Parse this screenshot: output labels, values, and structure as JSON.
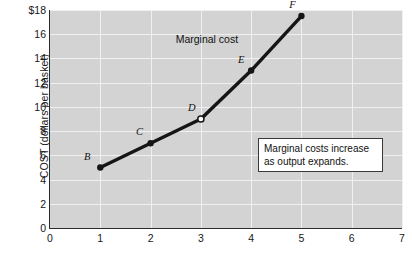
{
  "chart_data": {
    "type": "line",
    "title": "",
    "xlabel": "",
    "ylabel": "COST (dollars per basket)",
    "xlim": [
      0,
      7
    ],
    "ylim": [
      0,
      18
    ],
    "grid": true,
    "legend_position": "none",
    "x": [
      1,
      2,
      3,
      4,
      5
    ],
    "values": [
      5,
      7,
      9,
      13,
      17.5
    ],
    "series": [
      {
        "name": "Marginal cost",
        "x": [
          1,
          2,
          3,
          4,
          5
        ],
        "values": [
          5,
          7,
          9,
          13,
          17.5
        ]
      }
    ],
    "points": [
      {
        "label": "B",
        "x": 1,
        "y": 5,
        "marker": "filled"
      },
      {
        "label": "C",
        "x": 2,
        "y": 7,
        "marker": "filled"
      },
      {
        "label": "D",
        "x": 3,
        "y": 9,
        "marker": "open"
      },
      {
        "label": "E",
        "x": 4,
        "y": 13,
        "marker": "filled"
      },
      {
        "label": "F",
        "x": 5,
        "y": 17.5,
        "marker": "filled"
      }
    ],
    "y_ticks": [
      {
        "value": 18,
        "label": "$18"
      },
      {
        "value": 16,
        "label": "16"
      },
      {
        "value": 14,
        "label": "14"
      },
      {
        "value": 12,
        "label": "12"
      },
      {
        "value": 10,
        "label": "10"
      },
      {
        "value": 8,
        "label": "8"
      },
      {
        "value": 6,
        "label": "6"
      },
      {
        "value": 4,
        "label": "4"
      },
      {
        "value": 2,
        "label": "2"
      },
      {
        "value": 0,
        "label": "0"
      }
    ],
    "x_ticks": [
      {
        "value": 0,
        "label": "0"
      },
      {
        "value": 1,
        "label": "1"
      },
      {
        "value": 2,
        "label": "2"
      },
      {
        "value": 3,
        "label": "3"
      },
      {
        "value": 4,
        "label": "4"
      },
      {
        "value": 5,
        "label": "5"
      },
      {
        "value": 6,
        "label": "6"
      },
      {
        "value": 7,
        "label": "7"
      }
    ],
    "annotations": [
      {
        "name": "curve-label",
        "text": "Marginal cost",
        "x": 3.12,
        "y": 15.6
      },
      {
        "name": "callout-box",
        "lines": [
          "Marginal costs increase",
          "as output expands."
        ]
      }
    ],
    "colors": {
      "plot_background": "#d3d3d3",
      "gridline": "#f0f0f0",
      "axis": "#2b2b2b",
      "series_line": "#151515",
      "marker_fill": "#151515",
      "marker_open_fill": "#ffffff",
      "page_background": "#ffffff",
      "text": "#111111"
    }
  }
}
